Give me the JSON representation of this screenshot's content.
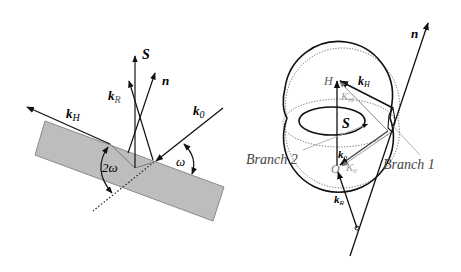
{
  "left_diagram": {
    "labels": {
      "S": "S",
      "n": "n",
      "kR_main": "k",
      "kR_sub": "R",
      "kH_main": "k",
      "kH_sub": "H",
      "k0_main": "k",
      "k0_sub": "0",
      "two_omega": "2ω",
      "omega": "ω"
    },
    "colors": {
      "slab": "#bdbdbd",
      "slab_edge": "#8a8a8a",
      "line": "#111111"
    }
  },
  "right_diagram": {
    "labels": {
      "n": "n",
      "H": "H",
      "O": "O",
      "S": "S",
      "kH_main": "k",
      "kH_sub": "H",
      "KH_main": "K",
      "KH_sub": "H",
      "k0_main": "k",
      "k0_sub": "0",
      "K0_main": "K",
      "K0_sub": "0",
      "kR_main": "k",
      "kR_sub": "R",
      "branch1": "Branch 1",
      "branch2": "Branch 2"
    },
    "colors": {
      "line": "#111111",
      "gray": "#8c8c8c",
      "dotted": "#555555"
    }
  }
}
